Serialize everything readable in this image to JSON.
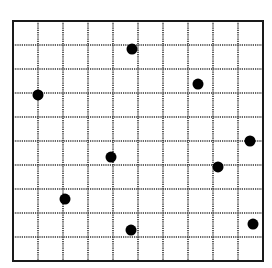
{
  "grid": {
    "columns": 10,
    "rows": 10,
    "origin_px": [
      13,
      21
    ],
    "cell_width_px": 25,
    "cell_height_px": 24,
    "border_color": "#1a1a1a",
    "line_color": "#333333",
    "line_style": "dotted"
  },
  "points": [
    {
      "col": 4.76,
      "row": 1.17
    },
    {
      "col": 1.0,
      "row": 3.08
    },
    {
      "col": 7.4,
      "row": 2.63
    },
    {
      "col": 3.92,
      "row": 5.67
    },
    {
      "col": 9.48,
      "row": 5.0
    },
    {
      "col": 8.2,
      "row": 6.08
    },
    {
      "col": 2.08,
      "row": 7.42
    },
    {
      "col": 4.72,
      "row": 8.71
    },
    {
      "col": 9.6,
      "row": 8.46
    }
  ],
  "point_style": {
    "radius_px": 5.5,
    "color": "#000000"
  }
}
